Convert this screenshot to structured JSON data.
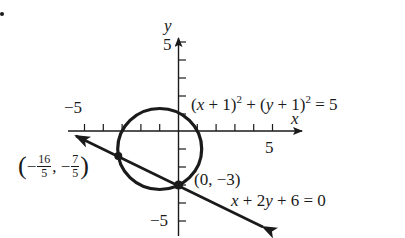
{
  "figure": {
    "bullet": "•",
    "axes": {
      "x_label": "x",
      "y_label": "y",
      "x_tick_labels": [
        {
          "value": -5,
          "text": "−5"
        },
        {
          "value": 5,
          "text": "5"
        }
      ],
      "y_tick_labels": [
        {
          "value": 5,
          "text": "5"
        },
        {
          "value": -5,
          "text": "−5"
        }
      ],
      "x_range": [
        -6,
        7
      ],
      "y_range": [
        -6,
        6
      ],
      "tick_step": 1
    },
    "circle": {
      "equation_parts": {
        "open1": "(",
        "x": "x",
        "plus1": " + 1)",
        "exp1": "2",
        "plus_mid": " + (",
        "y": "y",
        "plus2": " + 1)",
        "exp2": "2",
        "equals": " = 5"
      },
      "center": [
        -1,
        -1
      ],
      "radius_squared": 5
    },
    "line": {
      "equation_parts": {
        "x": "x",
        "plus1": " + 2",
        "y": "y",
        "rest": " + 6 = 0"
      },
      "coefficients": {
        "a": 1,
        "b": 2,
        "c": 6
      }
    },
    "intersection_points": [
      {
        "label_parts": {
          "open": "(",
          "minus1": "−",
          "num1": "16",
          "den1": "5",
          "comma": ", −",
          "num2": "7",
          "den2": "5",
          "close": ")"
        },
        "x": -3.2,
        "y": -1.4
      },
      {
        "label": "(0, −3)",
        "x": 0,
        "y": -3
      }
    ],
    "colors": {
      "ink": "#1a1a1a",
      "background": "#ffffff"
    }
  }
}
